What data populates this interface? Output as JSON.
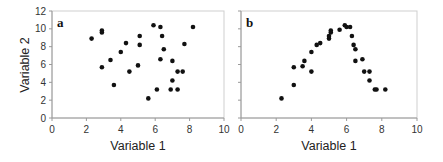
{
  "chart_data": [
    {
      "type": "scatter",
      "panel": "a",
      "title": "",
      "xlabel": "Variable 1",
      "ylabel": "Variable 2",
      "xlim": [
        0,
        10
      ],
      "ylim": [
        0,
        12
      ],
      "xticks": [
        0,
        2,
        4,
        6,
        8,
        10
      ],
      "yticks": [
        0,
        2,
        4,
        6,
        8,
        10,
        12
      ],
      "grid": false,
      "points": [
        [
          2.3,
          8.9
        ],
        [
          2.9,
          9.8
        ],
        [
          2.9,
          9.6
        ],
        [
          2.9,
          5.7
        ],
        [
          3.4,
          6.5
        ],
        [
          3.6,
          3.7
        ],
        [
          4.0,
          7.4
        ],
        [
          4.3,
          8.4
        ],
        [
          4.5,
          5.2
        ],
        [
          5.0,
          5.9
        ],
        [
          5.1,
          9.2
        ],
        [
          5.1,
          8.2
        ],
        [
          5.6,
          2.2
        ],
        [
          5.9,
          10.4
        ],
        [
          6.1,
          3.2
        ],
        [
          6.3,
          10.2
        ],
        [
          6.3,
          6.6
        ],
        [
          6.4,
          9.2
        ],
        [
          6.5,
          7.7
        ],
        [
          6.9,
          3.2
        ],
        [
          7.0,
          6.4
        ],
        [
          7.0,
          4.2
        ],
        [
          7.3,
          5.2
        ],
        [
          7.3,
          3.2
        ],
        [
          7.6,
          5.2
        ],
        [
          7.7,
          8.3
        ],
        [
          8.2,
          10.2
        ]
      ]
    },
    {
      "type": "scatter",
      "panel": "b",
      "title": "",
      "xlabel": "Variable 1",
      "ylabel": "",
      "xlim": [
        0,
        10
      ],
      "ylim": [
        0,
        12
      ],
      "xticks": [
        0,
        2,
        4,
        6,
        8,
        10
      ],
      "yticks": [
        0,
        2,
        4,
        6,
        8,
        10,
        12
      ],
      "grid": false,
      "points": [
        [
          2.3,
          2.2
        ],
        [
          3.0,
          3.7
        ],
        [
          3.0,
          5.7
        ],
        [
          3.5,
          5.8
        ],
        [
          3.6,
          6.4
        ],
        [
          4.0,
          7.4
        ],
        [
          4.0,
          5.2
        ],
        [
          4.3,
          8.2
        ],
        [
          4.5,
          8.4
        ],
        [
          5.0,
          8.9
        ],
        [
          5.0,
          9.2
        ],
        [
          5.1,
          9.6
        ],
        [
          5.1,
          9.8
        ],
        [
          5.6,
          9.9
        ],
        [
          5.9,
          10.4
        ],
        [
          6.0,
          10.2
        ],
        [
          6.2,
          10.2
        ],
        [
          6.3,
          9.2
        ],
        [
          6.4,
          8.2
        ],
        [
          6.5,
          7.7
        ],
        [
          6.5,
          6.4
        ],
        [
          6.9,
          6.6
        ],
        [
          7.0,
          5.2
        ],
        [
          7.3,
          5.2
        ],
        [
          7.3,
          4.2
        ],
        [
          7.6,
          3.2
        ],
        [
          7.7,
          3.2
        ],
        [
          8.2,
          3.2
        ]
      ]
    }
  ],
  "panels": {
    "a": {
      "letter": "a",
      "xlabel": "Variable 1",
      "ylabel": "Variable 2"
    },
    "b": {
      "letter": "b",
      "xlabel": "Variable 1"
    }
  },
  "colors": {
    "points": "#111111",
    "frame": "#c8c8c8",
    "axis": "#9a9a9a"
  }
}
